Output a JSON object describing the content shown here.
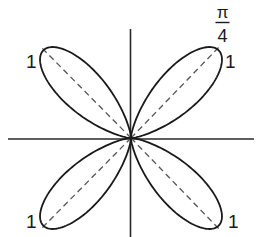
{
  "figure": {
    "curve": "four-petal rose",
    "colors": {
      "background": "#ffffff",
      "curve": "#1a1a1a",
      "axes": "#2a2a2a",
      "dashed": "#555555"
    },
    "labels": {
      "top_left_radius": "1",
      "top_right_radius": "1",
      "bottom_left_radius": "1",
      "bottom_right_radius": "1",
      "angle_numerator": "π",
      "angle_denominator": "4"
    }
  }
}
